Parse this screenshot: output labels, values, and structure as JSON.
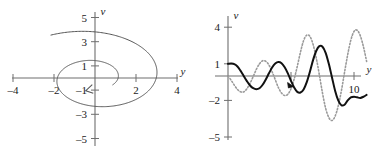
{
  "figure": {
    "name": "two-panel-oscillator-figure",
    "background_color": "#ffffff",
    "panels": [
      "phase-plane",
      "time-series"
    ]
  },
  "colors": {
    "axis": "#6e6e6e",
    "curve_dark": "#111111",
    "curve_light": "#9a9a9a",
    "curve_dotted": "#9a9a9a",
    "text": "#1a1a1a"
  },
  "chart_data": [
    {
      "id": "phase-plane",
      "type": "line",
      "title": "",
      "xlabel": "y",
      "ylabel": "v",
      "xlim": [
        -4.6,
        4.6
      ],
      "ylim": [
        -5.6,
        5.6
      ],
      "xticks": [
        -4,
        -2,
        2,
        4
      ],
      "xticklabels": [
        "–4",
        "–2",
        "2",
        "4"
      ],
      "yticks": [
        -5,
        -3,
        -1,
        1,
        3,
        5
      ],
      "yticklabels": [
        "–5",
        "–3",
        "–1",
        "1",
        "3",
        "5"
      ],
      "grid": false,
      "legend": "none",
      "annotations": [
        {
          "type": "arrowhead",
          "x": -0.45,
          "y": -1.05,
          "direction": "clockwise-inward"
        }
      ],
      "series": [
        {
          "name": "inward-spiral-trajectory",
          "style": "solid",
          "color": "#555555",
          "description": "Clockwise inward spiral from (-2.2, 3.5) decaying toward the origin",
          "parametric": {
            "t_start": 0.0,
            "t_end": 9.0,
            "r0": 4.15,
            "decay": 0.155,
            "theta0": 2.12,
            "direction": "clockwise"
          }
        }
      ]
    },
    {
      "id": "time-series",
      "type": "line",
      "title": "",
      "xlabel": "y",
      "ylabel": "v",
      "xlim": [
        -0.7,
        11.6
      ],
      "ylim": [
        -5.8,
        4.8
      ],
      "xticks": [
        5,
        10
      ],
      "xticklabels": [
        "",
        "10"
      ],
      "yticks": [
        -5,
        -2,
        1,
        4
      ],
      "yticklabels": [
        "–5",
        "–2",
        "1",
        "4"
      ],
      "grid": false,
      "legend": "none",
      "annotations": [
        {
          "type": "arrowhead",
          "x": 5.05,
          "y": -0.75,
          "direction": "right-down"
        }
      ],
      "series": [
        {
          "name": "solution-curve-solid",
          "style": "solid",
          "color": "#111111",
          "width": 2.0,
          "description": "Growing oscillation starting at v = 1, amplitude increasing with y",
          "samples_x": [
            0.0,
            0.25,
            0.5,
            0.75,
            1.0,
            1.25,
            1.5,
            1.75,
            2.0,
            2.25,
            2.5,
            2.75,
            3.0,
            3.25,
            3.5,
            3.75,
            4.0,
            4.25,
            4.5,
            4.75,
            5.0,
            5.25,
            5.5,
            5.75,
            6.0,
            6.25,
            6.5,
            6.75,
            7.0,
            7.25,
            7.5,
            7.75,
            8.0,
            8.25,
            8.5,
            8.75,
            9.0,
            9.25,
            9.5,
            9.75,
            10.0,
            10.25,
            10.5,
            10.75,
            11.0
          ],
          "samples_y": [
            1.0,
            1.02,
            0.98,
            0.78,
            0.42,
            0.0,
            -0.42,
            -0.78,
            -1.0,
            -1.08,
            -1.0,
            -0.72,
            -0.28,
            0.22,
            0.7,
            1.02,
            1.15,
            1.05,
            0.72,
            0.22,
            -0.4,
            -0.95,
            -1.3,
            -1.35,
            -1.1,
            -0.5,
            0.35,
            1.3,
            2.05,
            2.45,
            2.4,
            1.9,
            1.0,
            -0.1,
            -1.2,
            -2.0,
            -2.4,
            -2.35,
            -2.0,
            -1.75,
            -1.7,
            -1.75,
            -1.8,
            -1.7,
            -1.55
          ]
        },
        {
          "name": "solution-curve-dotted",
          "style": "dotted",
          "color": "#9a9a9a",
          "width": 1.6,
          "description": "Second growing oscillation, phase-shifted, starting near v = 0 with larger final amplitude",
          "samples_x": [
            0.0,
            0.25,
            0.5,
            0.75,
            1.0,
            1.25,
            1.5,
            1.75,
            2.0,
            2.25,
            2.5,
            2.75,
            3.0,
            3.25,
            3.5,
            3.75,
            4.0,
            4.25,
            4.5,
            4.75,
            5.0,
            5.25,
            5.5,
            5.75,
            6.0,
            6.25,
            6.5,
            6.75,
            7.0,
            7.25,
            7.5,
            7.75,
            8.0,
            8.25,
            8.5,
            8.75,
            9.0,
            9.25,
            9.5,
            9.75,
            10.0,
            10.25,
            10.5,
            10.75,
            11.0
          ],
          "samples_y": [
            0.0,
            -0.35,
            -0.75,
            -1.1,
            -1.3,
            -1.3,
            -1.05,
            -0.6,
            -0.05,
            0.55,
            1.0,
            1.25,
            1.2,
            0.9,
            0.35,
            -0.3,
            -0.95,
            -1.4,
            -1.6,
            -1.5,
            -1.05,
            -0.25,
            0.8,
            1.95,
            2.9,
            3.35,
            3.25,
            2.6,
            1.5,
            0.1,
            -1.4,
            -2.65,
            -3.4,
            -3.65,
            -3.3,
            -2.45,
            -1.2,
            0.3,
            1.75,
            2.95,
            3.65,
            3.75,
            3.3,
            2.4,
            1.2
          ]
        }
      ]
    }
  ]
}
